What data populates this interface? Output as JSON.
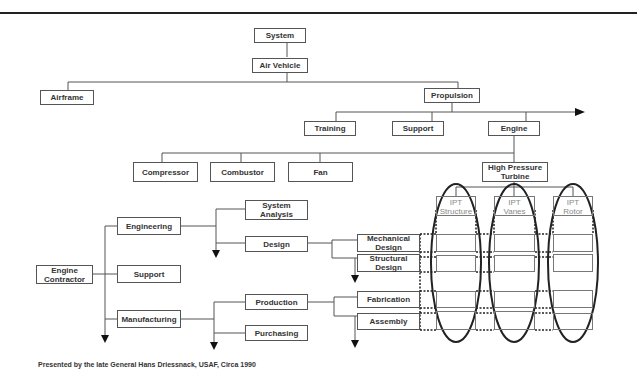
{
  "tree": {
    "system": "System",
    "air_vehicle": "Air Vehicle",
    "airframe": "Airframe",
    "propulsion": "Propulsion",
    "training": "Training",
    "support_top": "Support",
    "engine": "Engine",
    "compressor": "Compressor",
    "combustor": "Combustor",
    "fan": "Fan",
    "hpt": "High Pressure\nTurbine"
  },
  "ipts": [
    {
      "label": "IPT\nStructure"
    },
    {
      "label": "IPT\nVanes"
    },
    {
      "label": "IPT\nRotor"
    }
  ],
  "contractor": {
    "engine_contractor": "Engine\nContractor",
    "engineering": "Engineering",
    "support": "Support",
    "manufacturing": "Manufacturing",
    "system_analysis": "System\nAnalysis",
    "design": "Design",
    "production": "Production",
    "purchasing": "Purchasing",
    "mechanical_design": "Mechanical\nDesign",
    "structural_design": "Structural\nDesign",
    "fabrication": "Fabrication",
    "assembly": "Assembly"
  },
  "caption": "Presented by the late General Hans Driessnack, USAF,  Circa 1990"
}
